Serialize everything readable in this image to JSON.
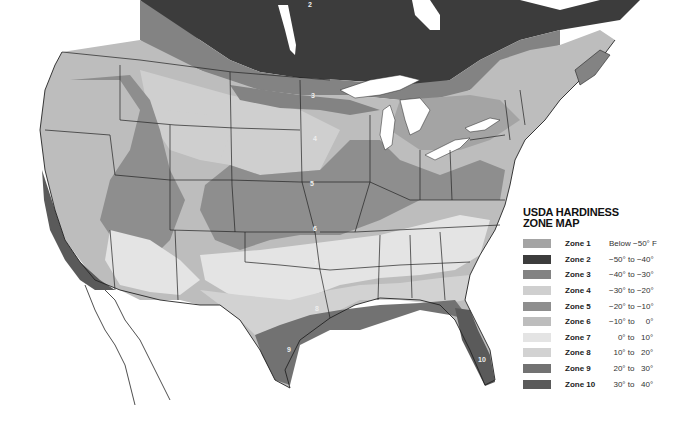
{
  "legend": {
    "title_line1": "USDA HARDINESS",
    "title_line2": "ZONE MAP",
    "zones": [
      {
        "label": "Zone 1",
        "range": "Below −50° F",
        "color": "#a4a4a4"
      },
      {
        "label": "Zone 2",
        "range": "−50° to −40°",
        "color": "#3c3c3c"
      },
      {
        "label": "Zone 3",
        "range": "−40° to −30°",
        "color": "#838383"
      },
      {
        "label": "Zone 4",
        "range": "−30° to −20°",
        "color": "#cfcfcf"
      },
      {
        "label": "Zone 5",
        "range": "−20° to −10°",
        "color": "#8e8e8e"
      },
      {
        "label": "Zone 6",
        "range": "−10° to     0°",
        "color": "#bdbdbd"
      },
      {
        "label": "Zone 7",
        "range": "    0° to   10°",
        "color": "#e4e4e4"
      },
      {
        "label": "Zone 8",
        "range": "  10° to   20°",
        "color": "#d2d2d2"
      },
      {
        "label": "Zone 9",
        "range": "  20° to   30°",
        "color": "#727272"
      },
      {
        "label": "Zone 10",
        "range": "  30° to   40°",
        "color": "#5a5a5a"
      }
    ]
  },
  "map_labels": {
    "z2": "2",
    "z3": "3",
    "z4": "4",
    "z5": "5",
    "z6": "6",
    "z7": "7",
    "z8": "8",
    "z9": "9",
    "z10": "10"
  }
}
